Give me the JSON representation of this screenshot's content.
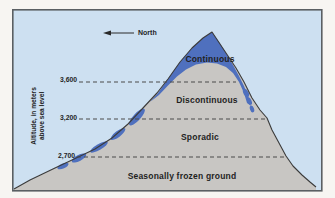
{
  "diagram": {
    "compass": {
      "label": "North"
    },
    "y_axis": {
      "label_line1": "Altitude, in meters",
      "label_line2": "above sea level",
      "ticks": [
        {
          "label": "3,600"
        },
        {
          "label": "3,200"
        },
        {
          "label": "2,700"
        }
      ]
    },
    "zones": [
      {
        "id": "continuous",
        "label": "Continuous"
      },
      {
        "id": "discontinuous",
        "label": "Discontinuous"
      },
      {
        "id": "sporadic",
        "label": "Sporadic"
      },
      {
        "id": "seasonally-frozen",
        "label": "Seasonally frozen ground"
      }
    ],
    "colors": {
      "sky": "#cde0f1",
      "mountain": "#c8c6c3",
      "permafrost_blue": "#4f70be",
      "outline": "#3b3b3b",
      "dashed_line": "#4a4a4a",
      "text": "#1f1f1f"
    }
  }
}
